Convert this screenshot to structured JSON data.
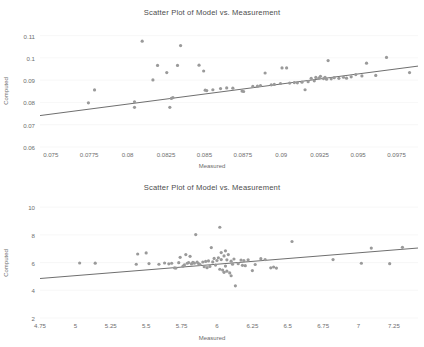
{
  "figure": {
    "background": "#ffffff",
    "point_color": "#9a9a9a",
    "line_color": "#6f6f6f",
    "text_color": "#6e6e6e"
  },
  "chart_data": [
    {
      "type": "scatter",
      "title": "Scatter Plot of Model vs. Measurement",
      "xlabel": "Measured",
      "ylabel": "Computed",
      "xlim": [
        0.0743,
        0.0989
      ],
      "ylim": [
        0.06,
        0.1125
      ],
      "xticks": [
        "0.075",
        "0.0775",
        "0.08",
        "0.0825",
        "0.085",
        "0.0875",
        "0.09",
        "0.0925",
        "0.095",
        "0.0975"
      ],
      "xtick_values": [
        0.075,
        0.0775,
        0.08,
        0.0825,
        0.085,
        0.0875,
        0.09,
        0.0925,
        0.095,
        0.0975
      ],
      "yticks": [
        "0.06",
        "0.07",
        "0.08",
        "0.09",
        "0.1",
        "0.11"
      ],
      "ytick_values": [
        0.06,
        0.07,
        0.08,
        0.09,
        0.1,
        0.11
      ],
      "grid": true,
      "legend": null,
      "fit_line": {
        "x": [
          0.0743,
          0.0989
        ],
        "y": [
          0.0741,
          0.0963
        ]
      },
      "points": [
        [
          0.07745,
          0.0798
        ],
        [
          0.07785,
          0.0856
        ],
        [
          0.08045,
          0.0803
        ],
        [
          0.08045,
          0.0778
        ],
        [
          0.08095,
          0.1075
        ],
        [
          0.08165,
          0.0901
        ],
        [
          0.08195,
          0.0966
        ],
        [
          0.08255,
          0.0934
        ],
        [
          0.08275,
          0.0778
        ],
        [
          0.08285,
          0.0818
        ],
        [
          0.08295,
          0.0822
        ],
        [
          0.08325,
          0.0966
        ],
        [
          0.08345,
          0.1055
        ],
        [
          0.08465,
          0.0967
        ],
        [
          0.08495,
          0.0941
        ],
        [
          0.08505,
          0.0855
        ],
        [
          0.08515,
          0.0853
        ],
        [
          0.08555,
          0.0857
        ],
        [
          0.08605,
          0.0862
        ],
        [
          0.08645,
          0.0865
        ],
        [
          0.08685,
          0.0864
        ],
        [
          0.08745,
          0.0851
        ],
        [
          0.08755,
          0.0849
        ],
        [
          0.08815,
          0.0872
        ],
        [
          0.08845,
          0.0873
        ],
        [
          0.08865,
          0.0876
        ],
        [
          0.08895,
          0.0932
        ],
        [
          0.08935,
          0.0879
        ],
        [
          0.08955,
          0.0881
        ],
        [
          0.08995,
          0.0885
        ],
        [
          0.09005,
          0.0955
        ],
        [
          0.09035,
          0.0955
        ],
        [
          0.09055,
          0.0887
        ],
        [
          0.09085,
          0.0889
        ],
        [
          0.09105,
          0.0888
        ],
        [
          0.09135,
          0.0891
        ],
        [
          0.09155,
          0.0857
        ],
        [
          0.09175,
          0.0893
        ],
        [
          0.09195,
          0.0908
        ],
        [
          0.09215,
          0.0897
        ],
        [
          0.09225,
          0.0912
        ],
        [
          0.09245,
          0.0909
        ],
        [
          0.09255,
          0.0917
        ],
        [
          0.09275,
          0.0907
        ],
        [
          0.09285,
          0.0913
        ],
        [
          0.09295,
          0.0904
        ],
        [
          0.09305,
          0.0988
        ],
        [
          0.09325,
          0.0906
        ],
        [
          0.09345,
          0.0911
        ],
        [
          0.09375,
          0.0908
        ],
        [
          0.09405,
          0.0913
        ],
        [
          0.09425,
          0.0909
        ],
        [
          0.09455,
          0.0915
        ],
        [
          0.09485,
          0.0925
        ],
        [
          0.09525,
          0.0919
        ],
        [
          0.09555,
          0.0976
        ],
        [
          0.09615,
          0.0921
        ],
        [
          0.09685,
          0.1002
        ],
        [
          0.09835,
          0.0934
        ]
      ]
    },
    {
      "type": "scatter",
      "title": "Scatter Plot of Model vs. Measurement",
      "xlabel": "Measured",
      "ylabel": "Computed",
      "xlim": [
        4.75,
        7.42
      ],
      "ylim": [
        2.0,
        10.3
      ],
      "xticks": [
        "4.75",
        "5",
        "5.25",
        "5.5",
        "5.75",
        "6",
        "6.25",
        "6.5",
        "6.75",
        "7",
        "7.25"
      ],
      "xtick_values": [
        4.75,
        5,
        5.25,
        5.5,
        5.75,
        6,
        6.25,
        6.5,
        6.75,
        7,
        7.25
      ],
      "yticks": [
        "2",
        "4",
        "6",
        "8",
        "10"
      ],
      "ytick_values": [
        2,
        4,
        6,
        8,
        10
      ],
      "grid": true,
      "legend": null,
      "fit_line": {
        "x": [
          4.75,
          7.42
        ],
        "y": [
          4.85,
          7.05
        ]
      },
      "points": [
        [
          5.03,
          5.97
        ],
        [
          5.14,
          5.96
        ],
        [
          5.43,
          5.88
        ],
        [
          5.44,
          6.62
        ],
        [
          5.5,
          6.7
        ],
        [
          5.52,
          5.93
        ],
        [
          5.59,
          5.88
        ],
        [
          5.63,
          5.97
        ],
        [
          5.66,
          5.91
        ],
        [
          5.68,
          5.95
        ],
        [
          5.7,
          5.62
        ],
        [
          5.71,
          5.6
        ],
        [
          5.73,
          5.99
        ],
        [
          5.74,
          6.38
        ],
        [
          5.76,
          5.74
        ],
        [
          5.77,
          5.83
        ],
        [
          5.78,
          6.58
        ],
        [
          5.79,
          5.95
        ],
        [
          5.8,
          6.0
        ],
        [
          5.81,
          6.45
        ],
        [
          5.82,
          5.9
        ],
        [
          5.83,
          6.02
        ],
        [
          5.84,
          5.96
        ],
        [
          5.85,
          8.02
        ],
        [
          5.86,
          6.03
        ],
        [
          5.87,
          5.93
        ],
        [
          5.88,
          5.86
        ],
        [
          5.9,
          6.04
        ],
        [
          5.91,
          5.7
        ],
        [
          5.92,
          6.08
        ],
        [
          5.93,
          5.63
        ],
        [
          5.94,
          6.12
        ],
        [
          5.95,
          5.72
        ],
        [
          5.96,
          7.08
        ],
        [
          5.97,
          6.05
        ],
        [
          5.98,
          6.3
        ],
        [
          5.99,
          5.82
        ],
        [
          6.0,
          6.15
        ],
        [
          6.01,
          6.35
        ],
        [
          6.02,
          8.55
        ],
        [
          6.02,
          5.52
        ],
        [
          6.03,
          6.22
        ],
        [
          6.03,
          6.72
        ],
        [
          6.04,
          5.46
        ],
        [
          6.05,
          6.48
        ],
        [
          6.05,
          5.3
        ],
        [
          6.06,
          6.85
        ],
        [
          6.06,
          5.75
        ],
        [
          6.07,
          6.2
        ],
        [
          6.07,
          5.38
        ],
        [
          6.08,
          6.58
        ],
        [
          6.09,
          5.25
        ],
        [
          6.1,
          6.1
        ],
        [
          6.1,
          5.05
        ],
        [
          6.11,
          5.88
        ],
        [
          6.12,
          6.26
        ],
        [
          6.13,
          4.32
        ],
        [
          6.15,
          5.92
        ],
        [
          6.17,
          6.18
        ],
        [
          6.18,
          5.8
        ],
        [
          6.19,
          6.14
        ],
        [
          6.2,
          5.78
        ],
        [
          6.22,
          6.2
        ],
        [
          6.25,
          5.42
        ],
        [
          6.27,
          5.86
        ],
        [
          6.31,
          6.28
        ],
        [
          6.34,
          6.22
        ],
        [
          6.38,
          5.62
        ],
        [
          6.4,
          5.68
        ],
        [
          6.42,
          5.6
        ],
        [
          6.53,
          7.52
        ],
        [
          6.82,
          6.22
        ],
        [
          7.02,
          5.95
        ],
        [
          7.09,
          7.05
        ],
        [
          7.22,
          5.92
        ],
        [
          7.31,
          7.1
        ]
      ]
    }
  ]
}
